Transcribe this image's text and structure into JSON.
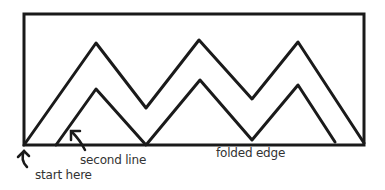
{
  "diagram": {
    "stroke_color": "#1a1a1a",
    "rectangle": {
      "x": 24,
      "y": 14,
      "width": 340,
      "height": 131
    },
    "outer_zigzag": "24,145 96,43 146,108 199,40 252,99 298,42 364,143",
    "inner_zigzag": "56,145 96,89 146,145 200,80 252,140 298,85 335,142",
    "labels": {
      "start_here": "start here",
      "second_line": "second line",
      "folded_edge": "folded edge"
    }
  }
}
